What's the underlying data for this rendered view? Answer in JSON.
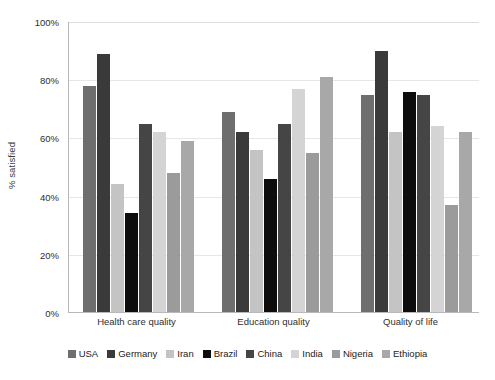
{
  "chart_data": {
    "type": "bar",
    "title": "",
    "subtitle": "",
    "xlabel": "",
    "ylabel": "% satisfied",
    "ylim": [
      0,
      100
    ],
    "ytick_labels": [
      "100%",
      "80%",
      "60%",
      "40%",
      "20%",
      "0%"
    ],
    "ytick_values": [
      100,
      80,
      60,
      40,
      20,
      0
    ],
    "grid": true,
    "legend_position": "bottom",
    "categories": [
      "Health care quality",
      "Education quality",
      "Quality of life"
    ],
    "series": [
      {
        "name": "USA",
        "color": "#6e6e6e",
        "values": [
          78,
          69,
          75
        ]
      },
      {
        "name": "Germany",
        "color": "#3a3a3a",
        "values": [
          89,
          62,
          90
        ]
      },
      {
        "name": "Iran",
        "color": "#c4c4c4",
        "values": [
          44,
          56,
          62
        ]
      },
      {
        "name": "Brazil",
        "color": "#0d0d0d",
        "values": [
          34,
          46,
          76
        ]
      },
      {
        "name": "China",
        "color": "#454545",
        "values": [
          65,
          65,
          75
        ]
      },
      {
        "name": "India",
        "color": "#d4d4d4",
        "values": [
          62,
          77,
          64
        ]
      },
      {
        "name": "Nigeria",
        "color": "#9b9b9b",
        "values": [
          48,
          55,
          37
        ]
      },
      {
        "name": "Ethiopia",
        "color": "#a8a8a8",
        "values": [
          59,
          81,
          62
        ]
      }
    ]
  }
}
